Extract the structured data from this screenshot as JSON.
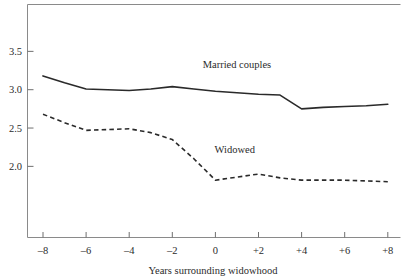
{
  "chart_data": {
    "type": "line",
    "title": "",
    "xlabel": "Years surrounding widowhood",
    "ylabel": "",
    "xlim": [
      -9,
      9
    ],
    "ylim": [
      1.55,
      3.78
    ],
    "grid": false,
    "legend_position": "inline-annotation",
    "x_tick_labels": [
      "–8",
      "–6",
      "–4",
      "–2",
      "0",
      "+2",
      "+4",
      "+6",
      "+8"
    ],
    "x_tick_values": [
      -8,
      -6,
      -4,
      -2,
      0,
      2,
      4,
      6,
      8
    ],
    "y_tick_labels": [
      "3.5",
      "3.0",
      "2.5",
      "2.0"
    ],
    "y_tick_values": [
      3.5,
      3.0,
      2.5,
      2.0
    ],
    "series": [
      {
        "name": "Married couples",
        "style": "solid",
        "color": "#2a2a2a",
        "label_x": 1.0,
        "label_y": 3.28,
        "x": [
          -8,
          -7,
          -6,
          -5,
          -4,
          -3,
          -2,
          -1,
          0,
          1,
          2,
          3,
          4,
          5,
          6,
          7,
          8
        ],
        "values": [
          3.18,
          3.09,
          3.01,
          3.0,
          2.99,
          3.01,
          3.04,
          3.01,
          2.98,
          2.96,
          2.94,
          2.93,
          2.75,
          2.77,
          2.78,
          2.79,
          2.81
        ]
      },
      {
        "name": "Widowed",
        "style": "dashed",
        "color": "#2a2a2a",
        "label_x": 0.9,
        "label_y": 2.17,
        "x": [
          -8,
          -7,
          -6,
          -5,
          -4,
          -3,
          -2,
          -1,
          0,
          1,
          2,
          3,
          4,
          5,
          6,
          7,
          8
        ],
        "values": [
          2.68,
          2.57,
          2.47,
          2.48,
          2.49,
          2.44,
          2.35,
          2.1,
          1.82,
          1.86,
          1.9,
          1.85,
          1.82,
          1.82,
          1.82,
          1.81,
          1.8
        ]
      }
    ]
  },
  "axis": {
    "x_title": "Years surrounding widowhood"
  },
  "labels": {
    "married": "Married couples",
    "widowed": "Widowed"
  },
  "ticks": {
    "y": [
      "3.5",
      "3.0",
      "2.5",
      "2.0"
    ],
    "x": [
      "–8",
      "–6",
      "–4",
      "–2",
      "0",
      "+2",
      "+4",
      "+6",
      "+8"
    ]
  }
}
